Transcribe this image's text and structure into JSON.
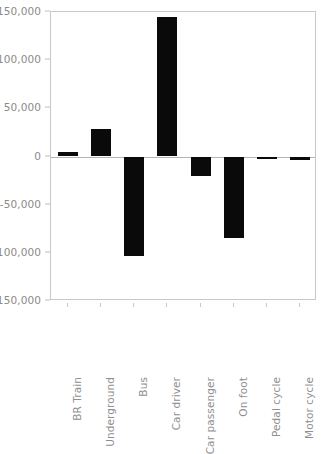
{
  "chart_data": {
    "type": "bar",
    "title": "",
    "subtitle": "",
    "xlabel": "",
    "ylabel": "",
    "categories": [
      "BR Train",
      "Underground",
      "Bus",
      "Car driver",
      "Car passenger",
      "On foot",
      "Pedal cycle",
      "Motor cycle"
    ],
    "values": [
      5000,
      29000,
      -103000,
      145000,
      -20000,
      -85000,
      -3000,
      -3500
    ],
    "ylim": [
      -150000,
      150000
    ],
    "yticks": [
      150000,
      100000,
      50000,
      0,
      -50000,
      -100000,
      -150000
    ],
    "ytick_labels": [
      "150,000",
      "100,000",
      "50,000",
      "0",
      "-50,000",
      "-100,000",
      "-150,000"
    ],
    "grid": false,
    "legend": null,
    "bar_color": "#0a0a0a",
    "axis_color": "#c9c9c9",
    "tick_label_color": "#8a8a8a"
  }
}
